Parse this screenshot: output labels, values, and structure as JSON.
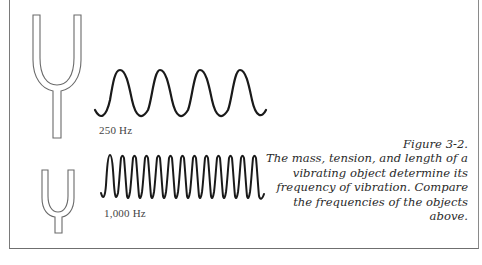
{
  "figure": {
    "title": "Figure 3-2.",
    "caption": "The mass, tension, and length of a vibrating object determine its frequency of vibration. Compare the frequencies of the objects above."
  },
  "objects": [
    {
      "name": "large tuning fork",
      "wave_label": "250 Hz",
      "wave_cycles": 4
    },
    {
      "name": "small tuning fork",
      "wave_label": "1,000 Hz",
      "wave_cycles": 12
    }
  ],
  "colors": {
    "wave": "#1a1a1a",
    "fork_outline": "#6a6a6a",
    "frame": "#7a7a7a",
    "caption_text": "#2a2a2a"
  }
}
